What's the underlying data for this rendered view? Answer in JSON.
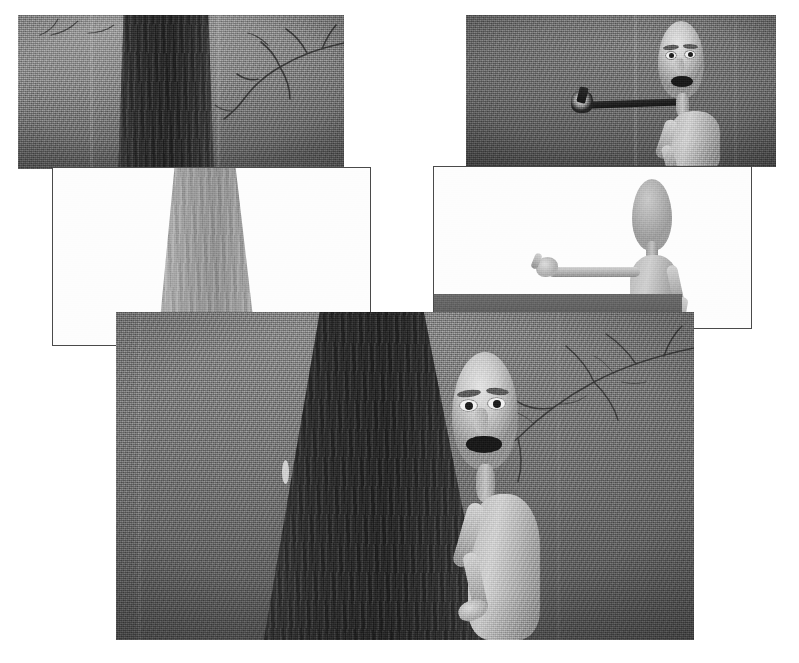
{
  "canvas": {
    "width": 799,
    "height": 663,
    "background_color": "#ffffff",
    "media_type": "grayscale photographic frame collage"
  },
  "palette": {
    "page_background": "#ffffff",
    "frame_border": "#4a4a4a",
    "night_mid_gray": "#6f6f6f",
    "night_dark_gray": "#4b4b4b",
    "trunk_dark": "#2c2c2c",
    "trunk_light": "#a6a6a6",
    "skin_light": "#cacaca",
    "mouth_black": "#1a1a1a",
    "white_plate": "#ffffff"
  },
  "collage": {
    "title": "Overlapping film stills",
    "panel_count": 5,
    "panels": [
      {
        "id": "panel-1",
        "name": "top-left-forest-wide",
        "caption": "Wide shot of a bare tree trunk at night with leafless branches at right",
        "x": 18,
        "y": 15,
        "width": 326,
        "height": 154,
        "z": 2,
        "style": "night",
        "bordered": false,
        "content": {
          "trunk": {
            "x": 100,
            "y": -6,
            "width": 96,
            "height": 168,
            "shade": "dark"
          },
          "branches": true,
          "character": "none"
        }
      },
      {
        "id": "panel-2",
        "name": "top-right-closeup-with-prop",
        "caption": "Close shot: startled bald character at right, dark tool held out to the left",
        "x": 466,
        "y": 15,
        "width": 310,
        "height": 152,
        "z": 2,
        "style": "dim",
        "bordered": false,
        "content": {
          "character": "startled-head-and-arm",
          "prop": "dark-horizontal-tool"
        }
      },
      {
        "id": "panel-3",
        "name": "mid-left-white-plate-trunk",
        "caption": "Bright/overexposed plate showing only the tapering tree trunk",
        "x": 53,
        "y": 168,
        "width": 317,
        "height": 177,
        "z": 3,
        "style": "white",
        "bordered": true,
        "content": {
          "trunk": {
            "x": 104,
            "y": -4,
            "width": 96,
            "height": 186,
            "shade": "light"
          },
          "character": "none"
        }
      },
      {
        "id": "panel-4",
        "name": "mid-right-white-plate-figure",
        "caption": "Bright plate: thin grey figure pointing with outstretched left arm",
        "x": 434,
        "y": 167,
        "width": 317,
        "height": 161,
        "z": 3,
        "style": "white",
        "bordered": true,
        "content": {
          "character": "pointing-figure",
          "ground_band": true
        }
      },
      {
        "id": "panel-5",
        "name": "bottom-large-shot",
        "caption": "Large night shot: character peering out from behind the tree trunk, mouth open",
        "x": 116,
        "y": 312,
        "width": 578,
        "height": 328,
        "z": 4,
        "style": "dark",
        "bordered": false,
        "content": {
          "trunk": {
            "x": 150,
            "y": -10,
            "width": 215,
            "height": 350,
            "shade": "dark"
          },
          "branches": true,
          "character": "peering-figure",
          "speck": true
        }
      }
    ]
  },
  "figure_elements": {
    "head_label": "bald elongated head",
    "eye_label": "wide open eye",
    "brow_label": "raised eyebrow",
    "mouth_label": "open mouth",
    "arm_label": "thin arm",
    "hand_label": "pointing hand",
    "trunk_label": "tree trunk",
    "branch_label": "bare branch",
    "prop_label": "dark handheld tool"
  }
}
